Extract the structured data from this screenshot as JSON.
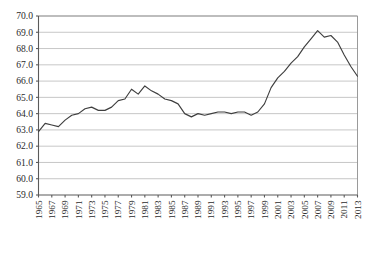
{
  "chart_data": {
    "type": "line",
    "title": "",
    "subtitle": "",
    "xlabel": "",
    "ylabel": "",
    "grid": true,
    "legend": false,
    "legend_position": "none",
    "xlim": [
      1965,
      2013
    ],
    "ylim": [
      59.0,
      70.0
    ],
    "ytick_step": 1.0,
    "xtick_step": 2,
    "ytick_labels": [
      "70.0",
      "69.0",
      "68.0",
      "67.0",
      "66.0",
      "65.0",
      "64.0",
      "63.0",
      "62.0",
      "61.0",
      "60.0",
      "59.0"
    ],
    "ytick_values": [
      70.0,
      69.0,
      68.0,
      67.0,
      66.0,
      65.0,
      64.0,
      63.0,
      62.0,
      61.0,
      60.0,
      59.0
    ],
    "xtick_labels": [
      "1965",
      "1967",
      "1969",
      "1971",
      "1973",
      "1975",
      "1977",
      "1979",
      "1981",
      "1983",
      "1985",
      "1987",
      "1989",
      "1991",
      "1993",
      "1995",
      "1997",
      "1999",
      "2001",
      "2003",
      "2005",
      "2007",
      "2009",
      "2011",
      "2013"
    ],
    "x": [
      1965,
      1966,
      1967,
      1968,
      1969,
      1970,
      1971,
      1972,
      1973,
      1974,
      1975,
      1976,
      1977,
      1978,
      1979,
      1980,
      1981,
      1982,
      1983,
      1984,
      1985,
      1986,
      1987,
      1988,
      1989,
      1990,
      1991,
      1992,
      1993,
      1994,
      1995,
      1996,
      1997,
      1998,
      1999,
      2000,
      2001,
      2002,
      2003,
      2004,
      2005,
      2006,
      2007,
      2008,
      2009,
      2010,
      2011,
      2012,
      2013
    ],
    "series": [
      {
        "name": "series-1",
        "color": "#3f3f3f",
        "values": [
          62.9,
          63.4,
          63.3,
          63.2,
          63.6,
          63.9,
          64.0,
          64.3,
          64.4,
          64.2,
          64.2,
          64.4,
          64.8,
          64.9,
          65.5,
          65.2,
          65.7,
          65.4,
          65.2,
          64.9,
          64.8,
          64.6,
          64.0,
          63.8,
          64.0,
          63.9,
          64.0,
          64.1,
          64.1,
          64.0,
          64.1,
          64.1,
          63.9,
          64.1,
          64.6,
          65.6,
          66.2,
          66.6,
          67.1,
          67.5,
          68.1,
          68.6,
          69.1,
          68.7,
          68.8,
          68.4,
          67.6,
          66.9,
          66.3
        ]
      }
    ],
    "note": "final segment declines to 65.2 at right edge"
  },
  "axes": {
    "left_axis_name": "value-axis",
    "bottom_axis_name": "year-axis"
  }
}
